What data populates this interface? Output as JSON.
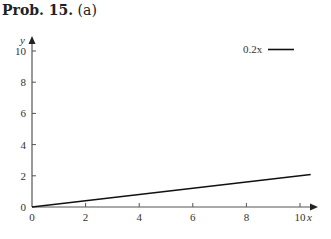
{
  "header": {
    "prob_label": "Prob. 15.",
    "part_label": "(a)"
  },
  "chart_data": {
    "type": "line",
    "title": "Prob. 15. (a)",
    "xlabel": "x",
    "ylabel": "y",
    "xlim": [
      0,
      10.4
    ],
    "ylim": [
      0,
      10.4
    ],
    "xticks": [
      0,
      2,
      4,
      6,
      8,
      10
    ],
    "yticks": [
      0,
      2,
      4,
      6,
      8,
      10
    ],
    "grid": false,
    "legend_position": "upper right",
    "series": [
      {
        "name": "0.2x",
        "x": [
          0,
          10.4
        ],
        "values": [
          0,
          2.08
        ],
        "color": "#111111"
      }
    ]
  },
  "legend": {
    "label": "0.2x"
  }
}
